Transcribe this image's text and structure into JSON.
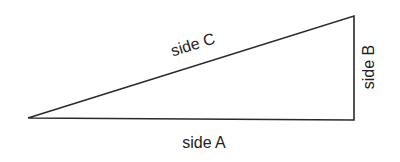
{
  "diagram": {
    "type": "right-triangle",
    "labels": {
      "side_a": "side A",
      "side_b": "side B",
      "side_c": "side C"
    },
    "colors": {
      "stroke": "#2a2a2a",
      "text": "#222222",
      "background": "#ffffff"
    }
  }
}
